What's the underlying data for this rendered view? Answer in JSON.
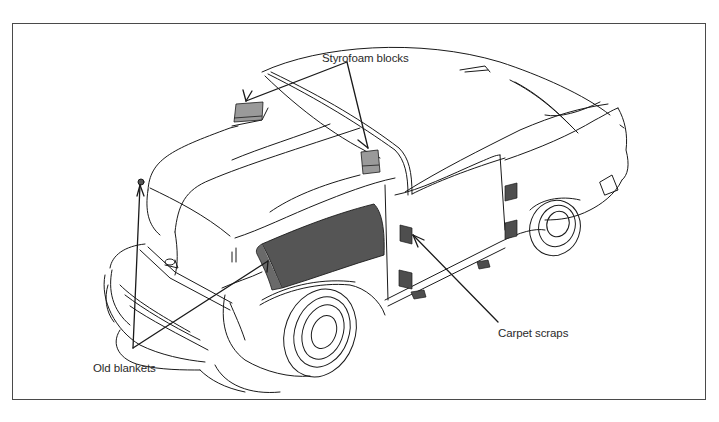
{
  "figure": {
    "type": "technical-illustration",
    "colors": {
      "line": "#1a1a1a",
      "frame": "#4a4a4a",
      "styrofoam_fill": "#9a9a9a",
      "blanket_fill": "#555555",
      "carpet_fill": "#4e4e4e",
      "background": "#ffffff"
    }
  },
  "labels": {
    "styrofoam": "Styrofoam blocks",
    "old_blankets": "Old blankets",
    "carpet_scraps": "Carpet scraps"
  }
}
